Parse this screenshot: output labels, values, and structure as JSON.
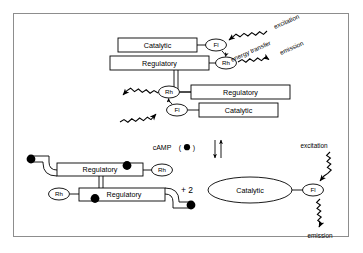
{
  "diagram": {
    "title_implicit": "PKA holoenzyme FRET dissociation scheme",
    "border_color": "#8d8d8d",
    "line_color": "#000000",
    "fill_color": "#ffffff"
  },
  "holoenzyme": {
    "top_catalytic": "Catalytic",
    "top_regulatory": "Regulatory",
    "top_fl": "Fl",
    "top_rh": "Rh",
    "bottom_regulatory": "Regulatory",
    "bottom_catalytic": "Catalytic",
    "bottom_rh": "Rh",
    "bottom_fl": "Fl"
  },
  "annotations": {
    "excitation_top": "excitation",
    "energy_transfer": "energy transfer",
    "emission_top": "emission"
  },
  "equilibrium": {
    "camp_label": "cAMP",
    "camp_open_paren": "(",
    "camp_close_paren": ")",
    "camp_symbol": "filled-circle"
  },
  "products": {
    "plus_two": "+ 2",
    "regulatory_dimer_top": "Regulatory",
    "regulatory_dimer_bottom": "Regulatory",
    "dimer_rh_right": "Rh",
    "dimer_rh_left": "Rh",
    "free_catalytic": "Catalytic",
    "free_fl": "Fl",
    "excitation_bottom": "excitation",
    "emission_bottom": "emission"
  },
  "camp_dots": {
    "count": 4,
    "color": "#000000"
  }
}
